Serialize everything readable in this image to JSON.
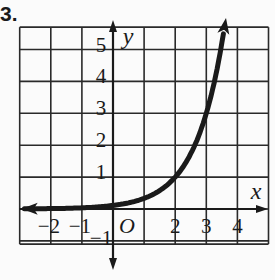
{
  "problem_number": "3.",
  "chart_data": {
    "type": "line",
    "title": "",
    "xlabel": "x",
    "ylabel": "y",
    "origin_label": "O",
    "xlim": [
      -3,
      5
    ],
    "ylim": [
      -2,
      6
    ],
    "grid": true,
    "x_tick_labels": [
      "−2",
      "−1",
      "2",
      "3",
      "4"
    ],
    "x_tick_values": [
      -2,
      -1,
      2,
      3,
      4
    ],
    "y_tick_labels": [
      "5",
      "4",
      "3",
      "2",
      "1",
      "−1"
    ],
    "y_tick_values": [
      5,
      4,
      3,
      2,
      1,
      -1
    ],
    "series": [
      {
        "name": "exponential curve",
        "function": "y = 3^(x-2)",
        "x": [
          -3,
          -2,
          -1,
          0,
          1,
          2,
          3,
          3.7
        ],
        "y": [
          0.004,
          0.012,
          0.037,
          0.11,
          0.33,
          1,
          3,
          6.5
        ],
        "arrows": "both"
      }
    ],
    "colors": {
      "grid": "#2a2a2a",
      "curve": "#1a1a1a",
      "background": "#fbfbfb"
    }
  }
}
